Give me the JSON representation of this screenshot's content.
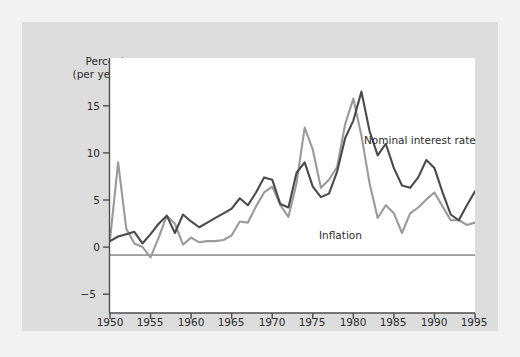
{
  "figure": {
    "background_color": "#dcdcdc",
    "plot_background_color": "#ffffff",
    "outer_background_color": "#f2f2f2"
  },
  "axis": {
    "y_title_line1": "Percent",
    "y_title_line2": "(per year)",
    "y_ticks": [
      "15",
      "10",
      "5",
      "0",
      "−5"
    ],
    "x_ticks": [
      "1950",
      "1955",
      "1960",
      "1965",
      "1970",
      "1975",
      "1980",
      "1985",
      "1990",
      "1995"
    ]
  },
  "series_labels": {
    "nominal": "Nominal interest rate",
    "inflation": "Inflation"
  },
  "chart_data": {
    "type": "line",
    "title": "",
    "xlabel": "",
    "ylabel": "Percent (per year)",
    "xlim": [
      1950,
      1995
    ],
    "ylim": [
      -5,
      17
    ],
    "ytick_values": [
      15,
      10,
      5,
      0,
      -5
    ],
    "xtick_values": [
      1950,
      1955,
      1960,
      1965,
      1970,
      1975,
      1980,
      1985,
      1990,
      1995
    ],
    "grid": false,
    "legend_position": "inline-annotations",
    "zero_line": true,
    "colors": {
      "nominal": "#4a4a4a",
      "inflation": "#9a9a9a",
      "axis": "#4d4d4d",
      "text": "#2b2b2b"
    },
    "x": [
      1950,
      1951,
      1952,
      1953,
      1954,
      1955,
      1956,
      1957,
      1958,
      1959,
      1960,
      1961,
      1962,
      1963,
      1964,
      1965,
      1966,
      1967,
      1968,
      1969,
      1970,
      1971,
      1972,
      1973,
      1974,
      1975,
      1976,
      1977,
      1978,
      1979,
      1980,
      1981,
      1982,
      1983,
      1984,
      1985,
      1986,
      1987,
      1988,
      1989,
      1990,
      1991,
      1992,
      1993,
      1994,
      1995
    ],
    "series": [
      {
        "name": "Nominal interest rate",
        "color": "#4a4a4a",
        "values": [
          1.2,
          1.6,
          1.8,
          2.0,
          1.0,
          1.8,
          2.7,
          3.4,
          1.9,
          3.5,
          2.9,
          2.4,
          2.8,
          3.2,
          3.6,
          4.0,
          4.9,
          4.3,
          5.4,
          6.7,
          6.5,
          4.4,
          4.1,
          7.1,
          8.0,
          5.9,
          5.0,
          5.3,
          7.2,
          10.1,
          11.6,
          14.1,
          10.7,
          8.6,
          9.6,
          7.5,
          6.0,
          5.8,
          6.7,
          8.2,
          7.5,
          5.4,
          3.5,
          3.0,
          4.3,
          5.5
        ]
      },
      {
        "name": "Inflation",
        "color": "#9a9a9a",
        "values": [
          1.3,
          8.0,
          2.3,
          1.0,
          0.7,
          -0.2,
          1.5,
          3.4,
          2.7,
          0.9,
          1.5,
          1.1,
          1.2,
          1.2,
          1.3,
          1.7,
          2.9,
          2.8,
          4.2,
          5.4,
          5.9,
          4.3,
          3.3,
          6.2,
          11.0,
          9.1,
          5.8,
          6.5,
          7.6,
          11.3,
          13.5,
          10.3,
          6.2,
          3.2,
          4.3,
          3.6,
          1.9,
          3.6,
          4.1,
          4.8,
          5.4,
          4.2,
          3.0,
          3.0,
          2.6,
          2.8
        ]
      }
    ]
  }
}
